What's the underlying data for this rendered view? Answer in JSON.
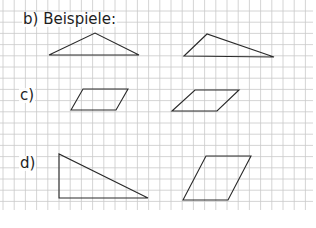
{
  "colors": {
    "grid": "#c9c9c9",
    "shape_stroke": "#2a2a2a",
    "background": "#ffffff",
    "text": "#1e1e1e"
  },
  "grid": {
    "cell_size": 11.2,
    "x_start": 3,
    "y_start": 0,
    "x_end": 313,
    "y_end": 210
  },
  "labels": [
    {
      "id": "b",
      "text": "b) Beispiele:",
      "x": 22,
      "y": 12
    },
    {
      "id": "c",
      "text": "c)",
      "x": 19,
      "y": 88
    },
    {
      "id": "d",
      "text": "d)",
      "x": 19,
      "y": 156
    }
  ],
  "shapes": [
    {
      "name": "b-triangle-obtuse-isosceles",
      "section": "b",
      "type": "triangle",
      "points": [
        [
          49,
          55
        ],
        [
          95,
          33
        ],
        [
          139,
          55
        ]
      ]
    },
    {
      "name": "b-triangle-obtuse-scalene",
      "section": "b",
      "type": "triangle",
      "points": [
        [
          184,
          56
        ],
        [
          207,
          34
        ],
        [
          274,
          57
        ]
      ]
    },
    {
      "name": "c-parallelogram-left",
      "section": "c",
      "type": "parallelogram",
      "points": [
        [
          71,
          110
        ],
        [
          83,
          89
        ],
        [
          128,
          89
        ],
        [
          116,
          110
        ]
      ]
    },
    {
      "name": "c-parallelogram-right",
      "section": "c",
      "type": "parallelogram",
      "points": [
        [
          172,
          111
        ],
        [
          195,
          90
        ],
        [
          239,
          90
        ],
        [
          217,
          111
        ]
      ]
    },
    {
      "name": "d-right-triangle",
      "section": "d",
      "type": "triangle",
      "points": [
        [
          59,
          154
        ],
        [
          59,
          198
        ],
        [
          148,
          198
        ]
      ]
    },
    {
      "name": "d-parallelogram",
      "section": "d",
      "type": "parallelogram",
      "points": [
        [
          183,
          200
        ],
        [
          206,
          156
        ],
        [
          251,
          156
        ],
        [
          228,
          200
        ]
      ]
    }
  ]
}
